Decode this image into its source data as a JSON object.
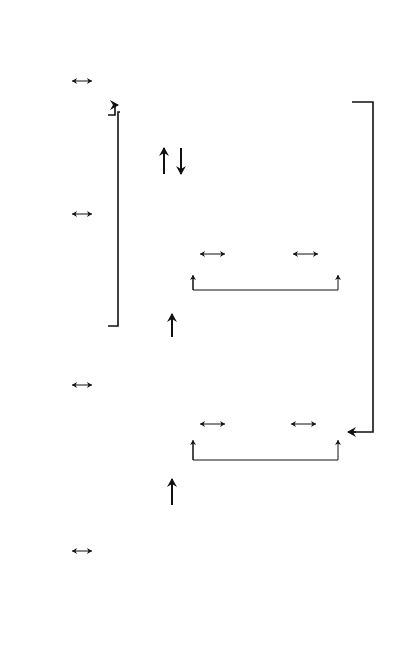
{
  "context": {
    "title": "Contextual factors",
    "parties": "Parties to the relationship",
    "task": "Task factors",
    "environmental": "Environmental factors",
    "company": "Company factors",
    "individual": "Individual and group factors",
    "g_label": "G"
  },
  "band_label": "Content and process of relationship development",
  "prerequisites": {
    "title": "Prerequisities for starting a business relationship",
    "title_line1": "Prerequisities for starting",
    "title_line2": "a business relationship",
    "items": [
      [
        "Complementary",
        "needs and resources",
        "between parties"
      ],
      [
        "Personal awareness of",
        "the other party's goals,",
        "needs and resources"
      ],
      [
        "Common interest",
        "in building",
        "a relationship"
      ]
    ]
  },
  "interaction": {
    "title": "Interaction processes",
    "items": [
      [
        "Exchange",
        "processes"
      ],
      [
        "Coordination",
        "processes"
      ],
      [
        "Adaptation",
        "processes"
      ]
    ]
  },
  "outcomes": {
    "title_line1": "Perceived outcomes",
    "title_line2": "of interaction processes",
    "items": [
      [
        "Performance outcome",
        "of an exchange",
        "process"
      ],
      [
        "Performance outcome",
        "of a business",
        "relationship"
      ],
      [
        "Psychosocial outcome",
        "of a business",
        "relationship"
      ]
    ]
  },
  "bonds": {
    "title": "Evolving bonds",
    "operational": "Operational bonds",
    "operational_items": [
      "Knowledge",
      "Social",
      "Economic",
      "Planning",
      "Legal"
    ],
    "relational": "Relational bonds",
    "relational_items": [
      "Attraction",
      "Trust",
      "Commitment"
    ]
  },
  "arrows": {
    "A": "A",
    "B": "B",
    "C": "C",
    "D": "D",
    "E": "E",
    "F": "F"
  },
  "legend": {
    "influence": [
      "denotes",
      "influence"
    ],
    "temporal": [
      "denotes temporal order and",
      "influence"
    ],
    "critical": [
      "denotes sources of potentially",
      "critical events in a relationship"
    ],
    "symbols_a": "A",
    "symbols_to": "to",
    "symbols_g": "G",
    "symbols_text": "symbols explained in the text"
  }
}
